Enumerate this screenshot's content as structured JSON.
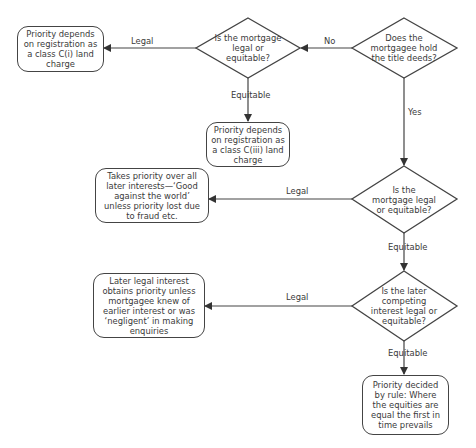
{
  "diagram": {
    "type": "flowchart",
    "decisions": [
      {
        "id": "d1",
        "text": "Does the mortgagee hold the title deeds?"
      },
      {
        "id": "d2",
        "text": "Is the mortgage legal or equitable?"
      },
      {
        "id": "d3",
        "text": "Is the mortgage legal or equitable?"
      },
      {
        "id": "d4",
        "text": "Is the later competing interest legal or equitable?"
      }
    ],
    "outcomes": [
      {
        "id": "o1",
        "text": "Priority depends on registration as a class C(i) land charge"
      },
      {
        "id": "o2",
        "text": "Priority depends on registration as a class C(iii) land charge"
      },
      {
        "id": "o3",
        "text": "Takes priority over all later interests—‘Good against the world’ unless priority lost due to fraud etc."
      },
      {
        "id": "o4",
        "text": "Later legal interest obtains priority unless mortgagee knew of earlier interest or was ‘negligent’ in making enquiries"
      },
      {
        "id": "o5",
        "text": "Priority decided by rule: Where the equities are equal the first in time prevails"
      }
    ],
    "edges": [
      {
        "from": "d1",
        "to": "d2",
        "label": "No"
      },
      {
        "from": "d1",
        "to": "d3",
        "label": "Yes"
      },
      {
        "from": "d2",
        "to": "o1",
        "label": "Legal"
      },
      {
        "from": "d2",
        "to": "o2",
        "label": "Equitable"
      },
      {
        "from": "d3",
        "to": "o3",
        "label": "Legal"
      },
      {
        "from": "d3",
        "to": "d4",
        "label": "Equitable"
      },
      {
        "from": "d4",
        "to": "o4",
        "label": "Legal"
      },
      {
        "from": "d4",
        "to": "o5",
        "label": "Equitable"
      }
    ]
  },
  "labels": {
    "no": "No",
    "yes": "Yes",
    "legal": "Legal",
    "equitable": "Equitable"
  },
  "colors": {
    "stroke": "#444444",
    "text": "#3a3a3a",
    "background": "#ffffff"
  }
}
